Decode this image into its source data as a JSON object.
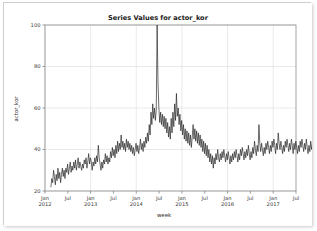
{
  "chart_data": {
    "type": "line",
    "title": "Series Values for actor_kor",
    "xlabel": "week",
    "ylabel": "actor_kor",
    "grid": true,
    "legend": "none",
    "xlim": [
      2012.0,
      2017.5
    ],
    "ylim": [
      20,
      100
    ],
    "yticks": [
      20,
      40,
      60,
      80,
      100
    ],
    "ytick_labels": [
      "20",
      "40",
      "60",
      "80",
      "100"
    ],
    "xticks": [
      2012.0,
      2012.5,
      2013.0,
      2013.5,
      2014.0,
      2014.5,
      2015.0,
      2015.5,
      2016.0,
      2016.5,
      2017.0,
      2017.5
    ],
    "xtick_labels": [
      {
        "month": "Jan",
        "year": "2012"
      },
      {
        "month": "Jul",
        "year": ""
      },
      {
        "month": "Jan",
        "year": "2013"
      },
      {
        "month": "Jul",
        "year": ""
      },
      {
        "month": "Jan",
        "year": "2014"
      },
      {
        "month": "Jul",
        "year": ""
      },
      {
        "month": "Jan",
        "year": "2015"
      },
      {
        "month": "Jul",
        "year": ""
      },
      {
        "month": "Jan",
        "year": "2016"
      },
      {
        "month": "Jul",
        "year": ""
      },
      {
        "month": "Jan",
        "year": "2017"
      },
      {
        "month": "Jul",
        "year": ""
      }
    ],
    "series": [
      {
        "name": "actor_kor",
        "color": "#1c1c1c",
        "x_start": 2012.13,
        "x_step": 0.019230769,
        "values": [
          22,
          26,
          24,
          30,
          27,
          23,
          28,
          25,
          31,
          26,
          29,
          24,
          28,
          31,
          27,
          30,
          26,
          31,
          29,
          33,
          28,
          31,
          34,
          29,
          32,
          30,
          34,
          31,
          35,
          30,
          33,
          36,
          31,
          34,
          32,
          30,
          33,
          31,
          35,
          33,
          36,
          31,
          34,
          38,
          33,
          36,
          34,
          30,
          34,
          32,
          36,
          33,
          37,
          34,
          42,
          36,
          33,
          30,
          34,
          31,
          35,
          33,
          38,
          34,
          37,
          33,
          36,
          34,
          39,
          36,
          41,
          37,
          40,
          36,
          42,
          38,
          44,
          39,
          43,
          40,
          47,
          41,
          44,
          40,
          43,
          39,
          45,
          41,
          44,
          40,
          43,
          39,
          42,
          38,
          41,
          37,
          40,
          43,
          39,
          42,
          38,
          41,
          45,
          40,
          43,
          39,
          44,
          41,
          46,
          43,
          48,
          44,
          52,
          47,
          58,
          52,
          62,
          55,
          60,
          54,
          59,
          100,
          72,
          60,
          53,
          58,
          52,
          57,
          51,
          56,
          50,
          55,
          48,
          53,
          46,
          51,
          45,
          55,
          48,
          58,
          51,
          62,
          54,
          67,
          56,
          60,
          52,
          57,
          49,
          54,
          47,
          52,
          45,
          50,
          44,
          49,
          43,
          48,
          42,
          47,
          41,
          46,
          52,
          45,
          50,
          44,
          49,
          43,
          48,
          42,
          47,
          41,
          45,
          39,
          44,
          38,
          43,
          37,
          42,
          36,
          40,
          34,
          38,
          33,
          37,
          31,
          36,
          33,
          38,
          35,
          40,
          36,
          34,
          38,
          35,
          39,
          36,
          40,
          37,
          34,
          38,
          35,
          39,
          36,
          33,
          37,
          34,
          38,
          35,
          39,
          36,
          40,
          37,
          34,
          38,
          35,
          40,
          37,
          41,
          38,
          35,
          39,
          36,
          40,
          37,
          42,
          38,
          35,
          39,
          36,
          41,
          38,
          44,
          40,
          37,
          42,
          39,
          52,
          43,
          39,
          43,
          40,
          37,
          41,
          38,
          43,
          40,
          44,
          41,
          38,
          42,
          39,
          44,
          41,
          45,
          42,
          38,
          43,
          40,
          48,
          43,
          40,
          44,
          41,
          38,
          42,
          39,
          44,
          41,
          45,
          42,
          39,
          43,
          40,
          45,
          42,
          38,
          43,
          40,
          44,
          41,
          38,
          42,
          39,
          44,
          41,
          45,
          42,
          39,
          43,
          40,
          45,
          41,
          38,
          42,
          39,
          44,
          40,
          43,
          40,
          37,
          41,
          38,
          43,
          40,
          44,
          41,
          38,
          42,
          39,
          43,
          40,
          44,
          41,
          38,
          42,
          39,
          44,
          40,
          43,
          40,
          37,
          41,
          38,
          43,
          39,
          42,
          39,
          36,
          40,
          37,
          42,
          38,
          41,
          38,
          35,
          39,
          36,
          41,
          38,
          43,
          40,
          37,
          41,
          38,
          43,
          40,
          44,
          41,
          38,
          42,
          39,
          44,
          40,
          37,
          35,
          38,
          41,
          37,
          40,
          36,
          39,
          54,
          42,
          38,
          35,
          39,
          42,
          38,
          41,
          37,
          40,
          44,
          41,
          38,
          42,
          46,
          41,
          38,
          43,
          40,
          44,
          41,
          38,
          42,
          45,
          41,
          38,
          43,
          40,
          44,
          41,
          38,
          42,
          39,
          43,
          40,
          44,
          41,
          38,
          42,
          39,
          43,
          40,
          37,
          41,
          38,
          42,
          39,
          40
        ]
      }
    ]
  }
}
